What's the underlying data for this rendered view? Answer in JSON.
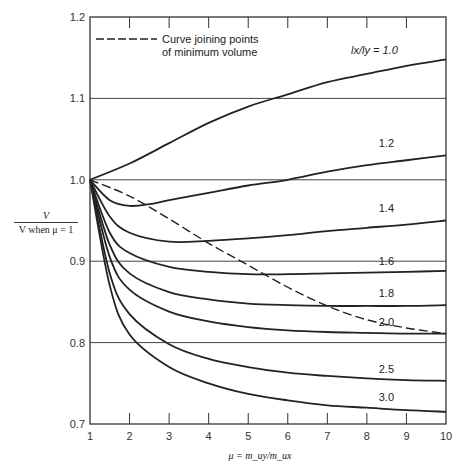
{
  "chart_data": {
    "type": "line",
    "title": "",
    "xlabel": "μ = m_uy/m_ux",
    "ylabel": "V / V when μ = 1",
    "xlim": [
      1,
      10
    ],
    "ylim": [
      0.7,
      1.2
    ],
    "x_ticks": [
      1,
      2,
      3,
      4,
      5,
      6,
      7,
      8,
      9,
      10
    ],
    "y_ticks": [
      0.7,
      0.8,
      0.9,
      1.0,
      1.1,
      1.2
    ],
    "y_tick_labels": [
      "0.7",
      "0.8",
      "0.9",
      "1.0",
      "1.1",
      "1.2"
    ],
    "grid": "horizontal",
    "legend": {
      "position": "top-left",
      "entries": [
        {
          "style": "dashed",
          "label_line1": "Curve joining points",
          "label_line2": "of minimum volume"
        }
      ]
    },
    "series": [
      {
        "name": "lx/ly = 1.0",
        "label": "l_x/l_y = 1.0",
        "label_pos": [
          7.6,
          1.155
        ],
        "points": [
          [
            1,
            1.0
          ],
          [
            2,
            1.02
          ],
          [
            3,
            1.045
          ],
          [
            4,
            1.07
          ],
          [
            5,
            1.09
          ],
          [
            6,
            1.105
          ],
          [
            7,
            1.12
          ],
          [
            8,
            1.13
          ],
          [
            9,
            1.14
          ],
          [
            10,
            1.148
          ]
        ]
      },
      {
        "name": "1.2",
        "label": "1.2",
        "label_pos": [
          8.3,
          1.04
        ],
        "points": [
          [
            1,
            1.0
          ],
          [
            1.5,
            0.975
          ],
          [
            2,
            0.968
          ],
          [
            2.5,
            0.97
          ],
          [
            3,
            0.975
          ],
          [
            4,
            0.984
          ],
          [
            5,
            0.993
          ],
          [
            6,
            1.0
          ],
          [
            7,
            1.01
          ],
          [
            8,
            1.018
          ],
          [
            9,
            1.024
          ],
          [
            10,
            1.03
          ]
        ]
      },
      {
        "name": "1.4",
        "label": "1.4",
        "label_pos": [
          8.3,
          0.96
        ],
        "points": [
          [
            1,
            1.0
          ],
          [
            1.5,
            0.955
          ],
          [
            2,
            0.935
          ],
          [
            3,
            0.924
          ],
          [
            4,
            0.925
          ],
          [
            5,
            0.928
          ],
          [
            6,
            0.932
          ],
          [
            7,
            0.937
          ],
          [
            8,
            0.941
          ],
          [
            9,
            0.945
          ],
          [
            10,
            0.95
          ]
        ]
      },
      {
        "name": "1.6",
        "label": "1.6",
        "label_pos": [
          8.3,
          0.895
        ],
        "points": [
          [
            1,
            1.0
          ],
          [
            1.5,
            0.935
          ],
          [
            2,
            0.91
          ],
          [
            3,
            0.893
          ],
          [
            4,
            0.887
          ],
          [
            5,
            0.884
          ],
          [
            6,
            0.884
          ],
          [
            7,
            0.885
          ],
          [
            8,
            0.886
          ],
          [
            9,
            0.887
          ],
          [
            10,
            0.888
          ]
        ]
      },
      {
        "name": "1.8",
        "label": "1.8",
        "label_pos": [
          8.3,
          0.856
        ],
        "points": [
          [
            1,
            1.0
          ],
          [
            1.5,
            0.92
          ],
          [
            2,
            0.885
          ],
          [
            3,
            0.862
          ],
          [
            4,
            0.853
          ],
          [
            5,
            0.848
          ],
          [
            6,
            0.846
          ],
          [
            7,
            0.845
          ],
          [
            8,
            0.845
          ],
          [
            9,
            0.845
          ],
          [
            10,
            0.846
          ]
        ]
      },
      {
        "name": "2.0",
        "label": "2.0",
        "label_pos": [
          8.3,
          0.82
        ],
        "points": [
          [
            1,
            1.0
          ],
          [
            1.5,
            0.905
          ],
          [
            2,
            0.865
          ],
          [
            3,
            0.838
          ],
          [
            4,
            0.826
          ],
          [
            5,
            0.819
          ],
          [
            6,
            0.815
          ],
          [
            7,
            0.813
          ],
          [
            8,
            0.812
          ],
          [
            9,
            0.811
          ],
          [
            10,
            0.811
          ]
        ]
      },
      {
        "name": "2.5",
        "label": "2.5",
        "label_pos": [
          8.3,
          0.763
        ],
        "points": [
          [
            1,
            1.0
          ],
          [
            1.5,
            0.885
          ],
          [
            2,
            0.835
          ],
          [
            3,
            0.798
          ],
          [
            4,
            0.78
          ],
          [
            5,
            0.77
          ],
          [
            6,
            0.763
          ],
          [
            7,
            0.759
          ],
          [
            8,
            0.756
          ],
          [
            9,
            0.754
          ],
          [
            10,
            0.753
          ]
        ]
      },
      {
        "name": "3.0",
        "label": "3.0",
        "label_pos": [
          8.3,
          0.728
        ],
        "points": [
          [
            1,
            1.0
          ],
          [
            1.5,
            0.87
          ],
          [
            2,
            0.81
          ],
          [
            3,
            0.77
          ],
          [
            4,
            0.75
          ],
          [
            5,
            0.737
          ],
          [
            6,
            0.729
          ],
          [
            7,
            0.723
          ],
          [
            8,
            0.72
          ],
          [
            9,
            0.717
          ],
          [
            10,
            0.715
          ]
        ]
      },
      {
        "name": "Curve joining points of minimum volume",
        "style": "dashed",
        "points": [
          [
            1,
            1.0
          ],
          [
            2,
            0.98
          ],
          [
            3,
            0.952
          ],
          [
            4,
            0.922
          ],
          [
            5,
            0.895
          ],
          [
            6,
            0.868
          ],
          [
            7,
            0.845
          ],
          [
            8,
            0.828
          ],
          [
            9,
            0.818
          ],
          [
            10,
            0.811
          ]
        ]
      }
    ]
  },
  "axis": {
    "ylabel_num": "V",
    "ylabel_den": "V when μ = 1",
    "xlabel": "μ = m_uy/m_ux"
  },
  "legend": {
    "line1": "Curve joining points",
    "line2": "of minimum volume"
  }
}
